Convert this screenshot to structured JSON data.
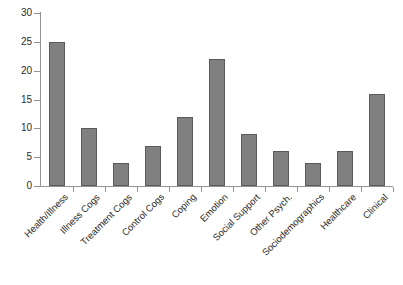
{
  "chart_data": {
    "type": "bar",
    "title": "",
    "subtitle": "",
    "xlabel": "",
    "ylabel": "",
    "ylim": [
      0,
      30
    ],
    "ytick_step": 5,
    "yticks": [
      0,
      5,
      10,
      15,
      20,
      25,
      30
    ],
    "grid": false,
    "legend": false,
    "legend_position": "none",
    "orientation": "vertical",
    "categories": [
      "Health/Illness",
      "Illness Cogs",
      "Treatment Cogs",
      "Control Cogs",
      "Coping",
      "Emotion",
      "Social Support",
      "Other Psych.",
      "Sociodemographics",
      "Healthcare",
      "Clinical"
    ],
    "values": [
      25,
      10,
      4,
      7,
      12,
      22,
      9,
      6,
      4,
      6,
      16
    ],
    "bars": [
      {
        "category": "Health/Illness",
        "value": 25
      },
      {
        "category": "Illness Cogs",
        "value": 10
      },
      {
        "category": "Treatment Cogs",
        "value": 4
      },
      {
        "category": "Control Cogs",
        "value": 7
      },
      {
        "category": "Coping",
        "value": 12
      },
      {
        "category": "Emotion",
        "value": 22
      },
      {
        "category": "Social Support",
        "value": 9
      },
      {
        "category": "Other Psych.",
        "value": 6
      },
      {
        "category": "Sociodemographics",
        "value": 4
      },
      {
        "category": "Healthcare",
        "value": 6
      },
      {
        "category": "Clinical",
        "value": 16
      }
    ]
  },
  "style": {
    "bar_fill": "#808080",
    "bar_border": "#5a5a5a",
    "axis_color": "#949494",
    "text_color": "#2b2b2b",
    "background": "#ffffff"
  }
}
